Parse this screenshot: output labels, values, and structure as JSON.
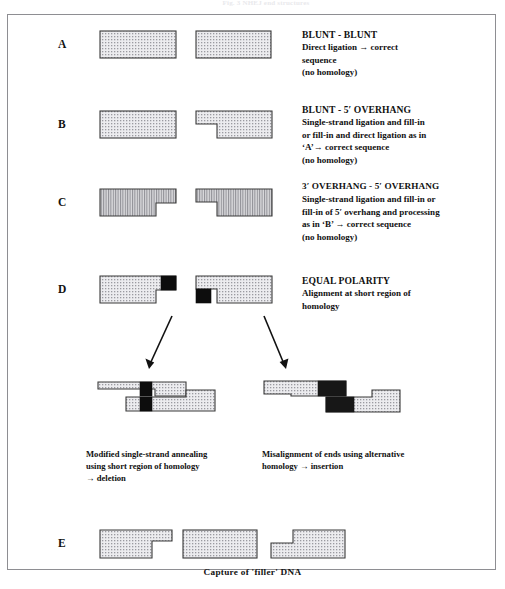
{
  "figure": {
    "top_faint_text": "Fig. 3  NHEJ  end  structures",
    "bottom_caption": "Capture of  'filler'  DNA"
  },
  "sections": [
    {
      "letter": "A",
      "heading": "BLUNT - BLUNT",
      "lines": [
        "Direct ligation →  correct",
        "sequence",
        "(no homology)"
      ]
    },
    {
      "letter": "B",
      "heading": "BLUNT - 5′ OVERHANG",
      "lines": [
        "Single-strand ligation and fill-in",
        "or fill-in and direct ligation as in",
        "‘A’→  correct sequence",
        "(no homology)"
      ]
    },
    {
      "letter": "C",
      "heading": "3′ OVERHANG - 5′ OVERHANG",
      "lines": [
        "Single-strand ligation and fill-in or",
        "fill-in of 5′ overhang and processing",
        "as in ‘B’  →  correct sequence",
        "(no homology)"
      ]
    },
    {
      "letter": "D",
      "heading": "EQUAL POLARITY",
      "lines": [
        "Alignment at short region of",
        "homology"
      ]
    },
    {
      "letter": "E",
      "heading": "",
      "lines": []
    }
  ],
  "outcomes": [
    {
      "name": "deletion-outcome",
      "lines": [
        "Modified single-strand annealing",
        "using short region of homology",
        "→  deletion"
      ]
    },
    {
      "name": "insertion-outcome",
      "lines": [
        "Misalignment of ends using alternative",
        "homology  →  insertion"
      ]
    }
  ],
  "colors": {
    "fill_light": "#e3e3e6",
    "stroke": "#3a3a3a",
    "homology_block": "#0d0d0d",
    "frame_border": "#8e8e92",
    "text": "#111111"
  }
}
